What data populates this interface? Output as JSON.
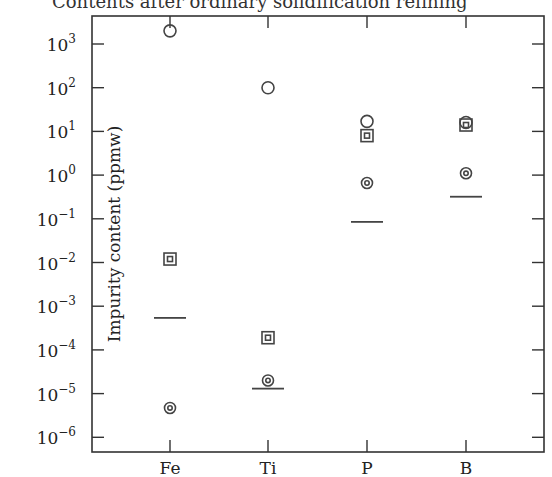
{
  "chart_data": {
    "type": "scatter",
    "title": "Contents after ordinary solidification refining",
    "xlabel": "",
    "ylabel": "Impurity content (ppmw)",
    "yscale": "log",
    "ylim": [
      1e-06,
      1000.0
    ],
    "yticks": [
      "10^3",
      "10^2",
      "10^1",
      "10^0",
      "10^-1",
      "10^-2",
      "10^-3",
      "10^-4",
      "10^-5",
      "10^-6"
    ],
    "categories": [
      "Fe",
      "Ti",
      "P",
      "B"
    ],
    "grid": false,
    "legend": "none",
    "series": [
      {
        "name": "open circle",
        "marker": "circle",
        "values": [
          2000,
          100,
          17,
          16
        ]
      },
      {
        "name": "double square",
        "marker": "square-in-square",
        "values": [
          0.012,
          0.00019,
          8,
          14
        ]
      },
      {
        "name": "double circle",
        "marker": "circle-in-circle",
        "values": [
          4.7e-06,
          2e-05,
          0.66,
          1.1
        ]
      },
      {
        "name": "horizontal bar",
        "marker": "hline",
        "values": [
          0.00054,
          1.3e-05,
          0.085,
          0.32
        ]
      }
    ]
  },
  "layout": {
    "plot": {
      "left": 92,
      "right": 544,
      "top": 16,
      "bottom": 452
    },
    "y_decade_px": 43.7,
    "y_ref": {
      "log": 3,
      "px": 44
    },
    "x_px": [
      170,
      268,
      367,
      466
    ],
    "colors": {
      "axis": "#333333",
      "marker": "#444444",
      "text": "#222222"
    }
  }
}
